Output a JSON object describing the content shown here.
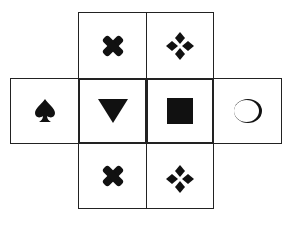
{
  "diagram": {
    "type": "cube-net",
    "cells": [
      {
        "id": "top-left",
        "row": 0,
        "col": 1,
        "symbol": "cross",
        "icon": "cross-icon"
      },
      {
        "id": "top-right",
        "row": 0,
        "col": 2,
        "symbol": "four-diamonds",
        "icon": "four-diamonds-icon"
      },
      {
        "id": "mid-1",
        "row": 1,
        "col": 0,
        "symbol": "spade",
        "icon": "spade-icon"
      },
      {
        "id": "mid-2",
        "row": 1,
        "col": 1,
        "symbol": "down-triangle",
        "icon": "down-triangle-icon"
      },
      {
        "id": "mid-3",
        "row": 1,
        "col": 2,
        "symbol": "filled-square",
        "icon": "filled-square-icon"
      },
      {
        "id": "mid-4",
        "row": 1,
        "col": 3,
        "symbol": "crescent-circle",
        "icon": "crescent-circle-icon"
      },
      {
        "id": "bottom-left",
        "row": 2,
        "col": 1,
        "symbol": "cross",
        "icon": "cross-icon"
      },
      {
        "id": "bottom-right",
        "row": 2,
        "col": 2,
        "symbol": "four-diamonds",
        "icon": "four-diamonds-icon"
      }
    ],
    "colors": {
      "line": "#222222",
      "fill": "#111111",
      "background": "#ffffff"
    }
  }
}
